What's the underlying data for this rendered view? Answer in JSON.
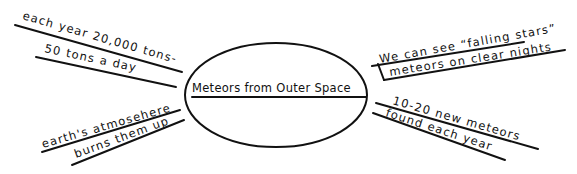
{
  "diagram": {
    "type": "web-organizer",
    "center": {
      "label": "Meteors from Outer Space"
    },
    "branches": [
      {
        "position": "upper-left",
        "lines": [
          "each year 20,000 tons-",
          "50 tons a day"
        ]
      },
      {
        "position": "lower-left",
        "lines": [
          "earth's atmosehere",
          "burns them up"
        ]
      },
      {
        "position": "upper-right",
        "lines": [
          "We can see “falling stars”",
          "meteors on clear nights"
        ]
      },
      {
        "position": "lower-right",
        "lines": [
          "10-20 new meteors",
          "found each year"
        ]
      }
    ],
    "colors": {
      "ink": "#111111",
      "background": "#ffffff"
    }
  }
}
